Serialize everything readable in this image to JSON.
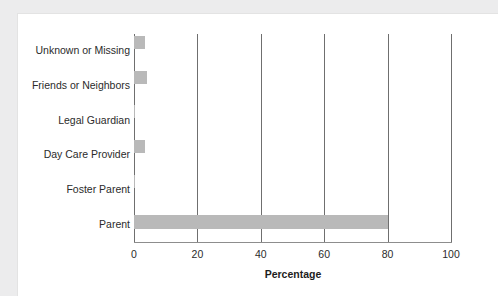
{
  "chart_data": {
    "type": "bar",
    "orientation": "horizontal",
    "title": "",
    "xlabel": "Percentage",
    "ylabel": "",
    "categories": [
      "Unknown or Missing",
      "Friends or Neighbors",
      "Legal Guardian",
      "Day Care Provider",
      "Foster Parent",
      "Parent"
    ],
    "values": [
      3.5,
      4,
      0.3,
      3.5,
      0.3,
      80
    ],
    "xlim": [
      0,
      100
    ],
    "xticks": [
      0,
      20,
      40,
      60,
      80,
      100
    ],
    "xtick_labels": [
      "0",
      "20",
      "40",
      "60",
      "80",
      "100"
    ],
    "grid": true,
    "legend": null,
    "bar_color": "#b9b9b9",
    "gridline_color": "#6f6f6f",
    "axis_color": "#8d8d8d",
    "background_color": "#ffffff",
    "page_background_color": "#ececed"
  }
}
